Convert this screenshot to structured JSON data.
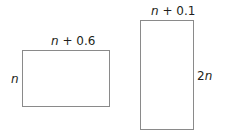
{
  "diagram": {
    "shapes": [
      {
        "id": "rect-left",
        "type": "rectangle",
        "width_label": "n + 0.6",
        "height_label": "n"
      },
      {
        "id": "rect-right",
        "type": "rectangle",
        "width_label": "n + 0.1",
        "height_label": "2n"
      }
    ],
    "labels": {
      "left_top": {
        "var": "n",
        "rest": " + 0.6"
      },
      "left_side": {
        "var": "n"
      },
      "right_top": {
        "var": "n",
        "rest": " + 0.1"
      },
      "right_side": {
        "coef": "2",
        "var": "n"
      }
    }
  }
}
